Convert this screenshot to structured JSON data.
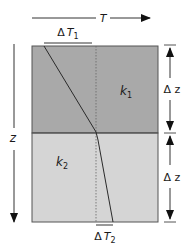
{
  "diagram": {
    "temperature_axis": {
      "label": "T"
    },
    "depth_axis": {
      "label": "z"
    },
    "layers": [
      {
        "name": "k",
        "sub": "1",
        "color": "#a9a9a9",
        "thickness_label": "Δ z"
      },
      {
        "name": "k",
        "sub": "2",
        "color": "#d5d5d5",
        "thickness_label": "Δ z"
      }
    ],
    "delta_T1": {
      "delta": "Δ",
      "symbol": "T",
      "sub": "1"
    },
    "delta_T2": {
      "delta": "Δ",
      "symbol": "T",
      "sub": "2"
    },
    "colors": {
      "line": "#2a2a2a",
      "boundary": "#555555",
      "dotted": "#666666"
    }
  }
}
